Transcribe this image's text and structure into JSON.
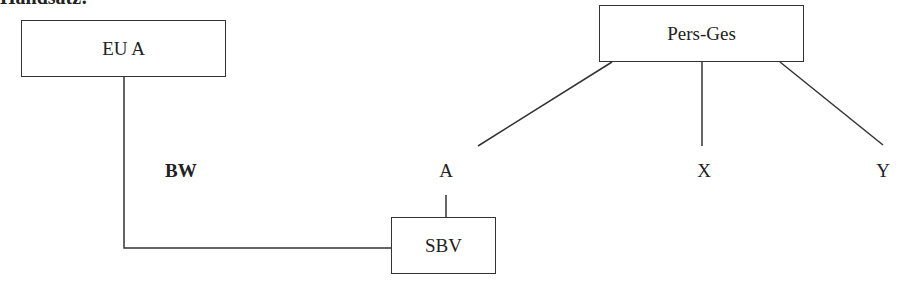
{
  "heading": "Handsatz:",
  "nodes": {
    "eu_a": "EU A",
    "pers_ges": "Pers-Ges",
    "sbv": "SBV"
  },
  "labels": {
    "bw": "BW",
    "a": "A",
    "x": "X",
    "y": "Y"
  },
  "colors": {
    "line": "#333333",
    "text": "#222222",
    "background": "#ffffff"
  }
}
